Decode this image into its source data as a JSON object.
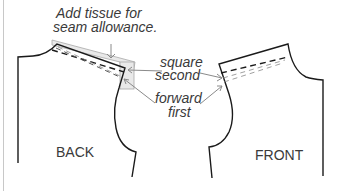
{
  "diagram": {
    "annotations": {
      "tissue_line1": "Add tissue for",
      "tissue_line2": "seam allowance.",
      "square_line1": "square",
      "square_line2": "second",
      "forward_line1": "forward",
      "forward_line2": "first"
    },
    "pieces": {
      "back_label": "BACK",
      "front_label": "FRONT"
    },
    "colors": {
      "outline": "#1a1a1a",
      "text": "#3a3a3a",
      "tissue_fill": "#e9e9e9",
      "tissue_stroke": "#a8a8a8",
      "leader": "#8a8a8a",
      "rule": "#c8c8c8"
    }
  }
}
